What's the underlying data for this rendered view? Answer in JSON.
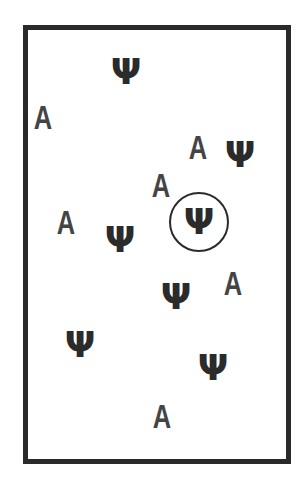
{
  "stimulus": {
    "psi_glyph": "Ψ",
    "a_glyph": "A",
    "items": [
      {
        "type": "psi",
        "x": 126,
        "y": 72
      },
      {
        "type": "a",
        "x": 43,
        "y": 117
      },
      {
        "type": "a",
        "x": 198,
        "y": 147
      },
      {
        "type": "psi",
        "x": 240,
        "y": 155
      },
      {
        "type": "a",
        "x": 161,
        "y": 185
      },
      {
        "type": "psi",
        "x": 199,
        "y": 222,
        "circled": true
      },
      {
        "type": "a",
        "x": 66,
        "y": 222
      },
      {
        "type": "psi",
        "x": 120,
        "y": 240
      },
      {
        "type": "a",
        "x": 233,
        "y": 283
      },
      {
        "type": "psi",
        "x": 176,
        "y": 297
      },
      {
        "type": "psi",
        "x": 80,
        "y": 345
      },
      {
        "type": "psi",
        "x": 213,
        "y": 368
      },
      {
        "type": "a",
        "x": 162,
        "y": 416
      }
    ]
  }
}
